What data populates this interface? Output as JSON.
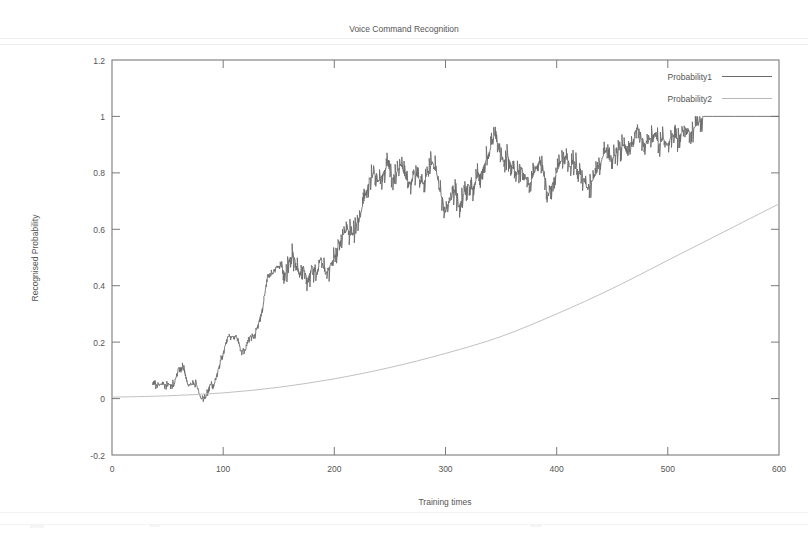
{
  "chart_data": {
    "type": "line",
    "title": "Voice Command Recognition",
    "xlabel": "Training times",
    "ylabel": "Recognised Probability",
    "xlim": [
      0,
      600
    ],
    "ylim": [
      -0.2,
      1.2
    ],
    "xticks": [
      "0",
      "100",
      "200",
      "300",
      "400",
      "500",
      "600"
    ],
    "xtick_values": [
      0,
      100,
      200,
      300,
      400,
      500,
      600
    ],
    "yticks": [
      "-0.2",
      "0",
      "0.2",
      "0.4",
      "0.6",
      "0.8",
      "1",
      "1.2"
    ],
    "ytick_values": [
      -0.2,
      0,
      0.2,
      0.4,
      0.6,
      0.8,
      1.0,
      1.2
    ],
    "grid": false,
    "legend_position": "top-right",
    "series": [
      {
        "name": "Probability1",
        "color": "#6b6b6b",
        "style": "solid-noisy-step",
        "x": [
          36,
          40,
          44,
          48,
          52,
          56,
          60,
          64,
          68,
          72,
          76,
          80,
          84,
          88,
          92,
          96,
          100,
          104,
          108,
          112,
          116,
          120,
          124,
          128,
          132,
          136,
          140,
          144,
          148,
          152,
          156,
          160,
          164,
          168,
          172,
          176,
          180,
          184,
          188,
          192,
          196,
          200,
          204,
          208,
          212,
          216,
          220,
          224,
          228,
          232,
          236,
          240,
          244,
          248,
          252,
          256,
          260,
          264,
          268,
          272,
          276,
          280,
          284,
          288,
          292,
          296,
          300,
          304,
          308,
          312,
          316,
          320,
          324,
          328,
          332,
          336,
          340,
          344,
          348,
          352,
          356,
          360,
          364,
          368,
          372,
          376,
          380,
          384,
          388,
          392,
          396,
          400,
          404,
          408,
          412,
          416,
          420,
          424,
          428,
          432,
          436,
          440,
          444,
          448,
          452,
          456,
          460,
          464,
          468,
          472,
          476,
          480,
          484,
          488,
          492,
          496,
          500,
          504,
          508,
          512,
          516,
          520,
          524,
          528,
          532,
          536,
          540,
          560,
          580,
          600
        ],
        "y": [
          0.05,
          0.05,
          0.05,
          0.05,
          0.05,
          0.05,
          0.11,
          0.11,
          0.05,
          0.05,
          0.05,
          0.0,
          0.0,
          0.05,
          0.05,
          0.11,
          0.16,
          0.22,
          0.22,
          0.22,
          0.17,
          0.17,
          0.22,
          0.22,
          0.27,
          0.33,
          0.44,
          0.44,
          0.47,
          0.47,
          0.44,
          0.5,
          0.5,
          0.44,
          0.47,
          0.42,
          0.47,
          0.44,
          0.5,
          0.44,
          0.47,
          0.5,
          0.55,
          0.58,
          0.6,
          0.58,
          0.62,
          0.66,
          0.72,
          0.78,
          0.8,
          0.77,
          0.8,
          0.83,
          0.78,
          0.8,
          0.83,
          0.78,
          0.76,
          0.8,
          0.78,
          0.76,
          0.8,
          0.84,
          0.8,
          0.72,
          0.66,
          0.7,
          0.74,
          0.68,
          0.72,
          0.76,
          0.74,
          0.78,
          0.8,
          0.84,
          0.88,
          0.94,
          0.88,
          0.84,
          0.86,
          0.82,
          0.8,
          0.82,
          0.78,
          0.76,
          0.8,
          0.84,
          0.8,
          0.72,
          0.76,
          0.8,
          0.84,
          0.86,
          0.82,
          0.84,
          0.8,
          0.78,
          0.74,
          0.77,
          0.8,
          0.84,
          0.88,
          0.84,
          0.86,
          0.88,
          0.9,
          0.86,
          0.9,
          0.96,
          0.92,
          0.9,
          0.92,
          0.94,
          0.9,
          0.92,
          0.9,
          0.94,
          0.92,
          0.94,
          0.96,
          0.94,
          0.96,
          0.98,
          1.0,
          1.0,
          1.0,
          1.0,
          1.0,
          1.0
        ]
      },
      {
        "name": "Probability2",
        "color": "#b9b9b9",
        "style": "solid-smooth",
        "x": [
          0,
          50,
          100,
          150,
          200,
          250,
          300,
          350,
          400,
          450,
          500,
          550,
          600
        ],
        "y": [
          0.005,
          0.01,
          0.02,
          0.04,
          0.07,
          0.11,
          0.16,
          0.22,
          0.3,
          0.39,
          0.49,
          0.59,
          0.69
        ]
      }
    ]
  },
  "axis": {
    "y_label": "Recognised Probability",
    "x_label": "Training times"
  },
  "legend": {
    "items": [
      {
        "label": "Probability1"
      },
      {
        "label": "Probability2"
      }
    ]
  }
}
